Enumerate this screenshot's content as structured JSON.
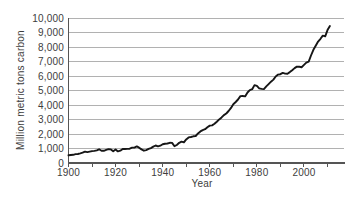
{
  "chart_data": {
    "type": "line",
    "title": "",
    "xlabel": "Year",
    "ylabel": "Million metric tons carbon",
    "xlim": [
      1900,
      2017
    ],
    "ylim": [
      0,
      10000
    ],
    "grid": "horizontal",
    "legend": "none",
    "yticks": [
      0,
      1000,
      2000,
      3000,
      4000,
      5000,
      6000,
      7000,
      8000,
      9000,
      10000
    ],
    "ytick_labels": [
      "0",
      "1,000",
      "2,000",
      "3,000",
      "4,000",
      "5,000",
      "6,000",
      "7,000",
      "8,000",
      "9,000",
      "10,000"
    ],
    "xticks_minor": [
      1900,
      1910,
      1920,
      1930,
      1940,
      1950,
      1960,
      1970,
      1980,
      1990,
      2000,
      2010
    ],
    "xticks_labeled": [
      1900,
      1920,
      1940,
      1960,
      1980,
      2000
    ],
    "xtick_labels": [
      "1900",
      "1920",
      "1940",
      "1960",
      "1980",
      "2000"
    ],
    "x": [
      1900,
      1901,
      1902,
      1903,
      1904,
      1905,
      1906,
      1907,
      1908,
      1909,
      1910,
      1911,
      1912,
      1913,
      1914,
      1915,
      1916,
      1917,
      1918,
      1919,
      1920,
      1921,
      1922,
      1923,
      1924,
      1925,
      1926,
      1927,
      1928,
      1929,
      1930,
      1931,
      1932,
      1933,
      1934,
      1935,
      1936,
      1937,
      1938,
      1939,
      1940,
      1941,
      1942,
      1943,
      1944,
      1945,
      1946,
      1947,
      1948,
      1949,
      1950,
      1951,
      1952,
      1953,
      1954,
      1955,
      1956,
      1957,
      1958,
      1959,
      1960,
      1961,
      1962,
      1963,
      1964,
      1965,
      1966,
      1967,
      1968,
      1969,
      1970,
      1971,
      1972,
      1973,
      1974,
      1975,
      1976,
      1977,
      1978,
      1979,
      1980,
      1981,
      1982,
      1983,
      1984,
      1985,
      1986,
      1987,
      1988,
      1989,
      1990,
      1991,
      1992,
      1993,
      1994,
      1995,
      1996,
      1997,
      1998,
      1999,
      2000,
      2001,
      2002,
      2003,
      2004,
      2005,
      2006,
      2007,
      2008,
      2009,
      2010,
      2011
    ],
    "values": [
      534,
      552,
      566,
      617,
      624,
      663,
      707,
      784,
      750,
      785,
      819,
      836,
      879,
      943,
      850,
      838,
      901,
      955,
      936,
      806,
      932,
      803,
      845,
      970,
      963,
      975,
      983,
      1062,
      1065,
      1145,
      1053,
      940,
      847,
      893,
      973,
      1027,
      1130,
      1209,
      1142,
      1192,
      1299,
      1334,
      1342,
      1391,
      1383,
      1160,
      1238,
      1392,
      1469,
      1419,
      1630,
      1767,
      1795,
      1841,
      1865,
      2042,
      2177,
      2270,
      2330,
      2462,
      2577,
      2594,
      2700,
      2848,
      3008,
      3145,
      3305,
      3411,
      3588,
      3800,
      4053,
      4208,
      4376,
      4614,
      4623,
      4596,
      4864,
      5026,
      5087,
      5369,
      5316,
      5152,
      5113,
      5094,
      5280,
      5439,
      5607,
      5752,
      5965,
      6096,
      6127,
      6217,
      6164,
      6162,
      6266,
      6398,
      6542,
      6651,
      6643,
      6610,
      6765,
      6927,
      6996,
      7416,
      7807,
      8093,
      8370,
      8566,
      8783,
      8740,
      9167,
      9449
    ],
    "colors": {
      "line": "#161616",
      "grid": "#a8a8a8",
      "axis": "#555555",
      "text": "#3d3d3d",
      "background": "#ffffff"
    }
  }
}
